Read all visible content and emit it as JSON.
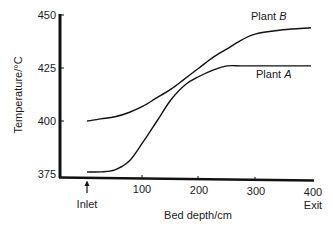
{
  "chart_data": {
    "type": "line",
    "title": "",
    "xlabel": "Bed depth/cm",
    "ylabel": "Temperature/°C",
    "xlim": [
      0,
      400
    ],
    "ylim": [
      375,
      450
    ],
    "x_ticks": [
      "100",
      "200",
      "300",
      "400"
    ],
    "y_ticks": [
      "375",
      "400",
      "425",
      "450"
    ],
    "annotations": [
      {
        "text": "Inlet",
        "x": 0,
        "arrow": true
      },
      {
        "text": "Exit",
        "x": 400
      }
    ],
    "grid": false,
    "x": [
      0,
      25,
      50,
      75,
      100,
      125,
      150,
      175,
      200,
      225,
      250,
      275,
      300,
      350,
      400
    ],
    "series": [
      {
        "name": "Plant B",
        "label": "Plant",
        "label_italic": "B",
        "values": [
          400,
          401,
          402,
          404,
          407,
          411,
          415,
          420,
          425,
          430,
          434,
          438,
          441,
          443,
          444
        ]
      },
      {
        "name": "Plant A",
        "label": "Plant",
        "label_italic": "A",
        "values": [
          376,
          376,
          377,
          381,
          390,
          400,
          410,
          417,
          421,
          424,
          426,
          426,
          426,
          426,
          426
        ]
      }
    ]
  }
}
